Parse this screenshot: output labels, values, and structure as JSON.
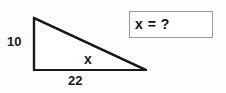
{
  "figure": {
    "type": "right-triangle-diagram",
    "shape_name": "right triangle",
    "vertical_leg_label": "10",
    "horizontal_leg_label": "22",
    "hypotenuse_label": "x",
    "stroke_color": "#1a1a1a",
    "fill_color": "#ffffff"
  },
  "answer_box": {
    "text": "x = ?",
    "border_color": "#9a9a9a",
    "background_color": "#ffffff"
  },
  "canvas": {
    "background_color": "#fdfdfd",
    "width": 226,
    "height": 93
  }
}
